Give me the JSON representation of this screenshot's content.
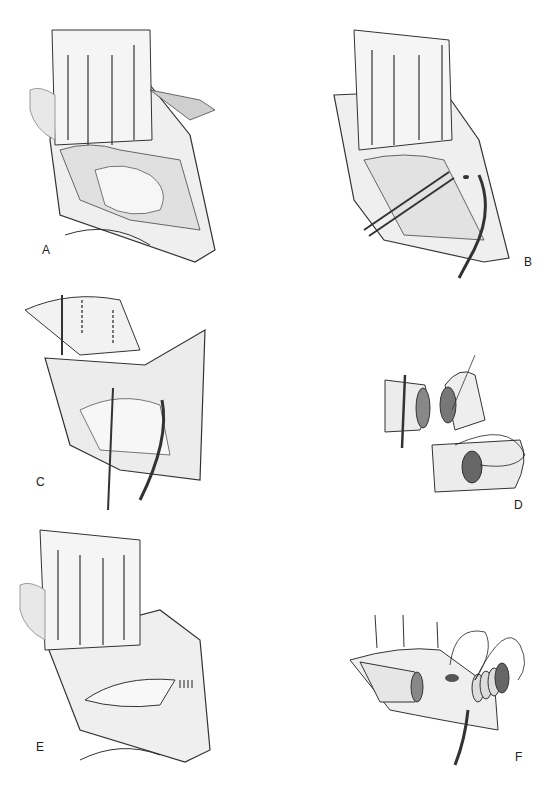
{
  "figure": {
    "panels": [
      {
        "id": "A",
        "label": "A",
        "description": "Retractor exposing operative field with anatomical structures"
      },
      {
        "id": "B",
        "label": "B",
        "description": "Forceps and suction in operative field with small sutures"
      },
      {
        "id": "C",
        "label": "C",
        "description": "Vessel with dashed incision lines, forceps and suction"
      },
      {
        "id": "D",
        "label": "D",
        "description": "Detail of vessel ends and suture anastomosis"
      },
      {
        "id": "E",
        "label": "E",
        "description": "Retractor with completed sutured repair"
      },
      {
        "id": "F",
        "label": "F",
        "description": "Vessel with stay sutures and ringed graft anastomosis"
      }
    ]
  },
  "colors": {
    "ink": "#2a2a2a",
    "shade": "#9a9a9a",
    "light": "#d8d8d8",
    "background": "#ffffff"
  }
}
